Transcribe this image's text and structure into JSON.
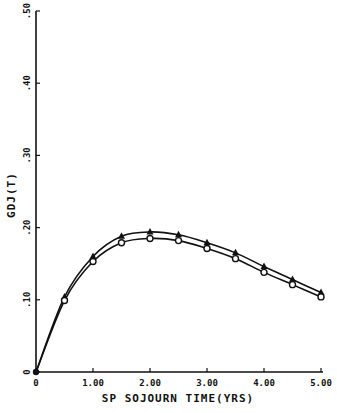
{
  "chart_data": {
    "type": "line",
    "title": "",
    "xlabel": "SP SOJOURN TIME(YRS)",
    "ylabel": "GDJ(T)",
    "xlim": [
      0,
      5
    ],
    "ylim": [
      0,
      0.5
    ],
    "x_ticks": [
      0,
      1,
      2,
      3,
      4,
      5
    ],
    "x_tick_labels": [
      "0",
      "1.00",
      "2.00",
      "3.00",
      "4.00",
      "5.00"
    ],
    "y_ticks": [
      0,
      0.1,
      0.2,
      0.3,
      0.4,
      0.5
    ],
    "y_tick_labels": [
      "0",
      ".10",
      ".20",
      ".30",
      ".40",
      ".50"
    ],
    "grid": false,
    "legend": null,
    "x": [
      0,
      0.5,
      1.0,
      1.5,
      2.0,
      2.5,
      3.0,
      3.5,
      4.0,
      4.5,
      5.0
    ],
    "series": [
      {
        "name": "triangle-series",
        "marker": "triangle",
        "values": [
          0,
          0.104,
          0.16,
          0.188,
          0.194,
          0.19,
          0.179,
          0.165,
          0.146,
          0.128,
          0.11
        ]
      },
      {
        "name": "circle-series",
        "marker": "circle",
        "values": [
          0,
          0.099,
          0.153,
          0.179,
          0.185,
          0.182,
          0.171,
          0.157,
          0.138,
          0.121,
          0.104
        ]
      }
    ]
  },
  "layout": {
    "origin_px": [
      36,
      372
    ],
    "x_max_px": 321,
    "y_max_px": 11,
    "line_color": "#111111"
  }
}
